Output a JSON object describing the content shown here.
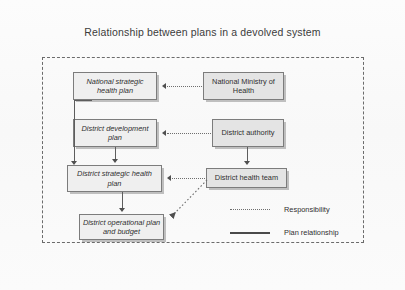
{
  "figure": {
    "title": "Relationship between plans in a devolved system"
  },
  "nodes": {
    "national_plan": "National strategic health plan",
    "district_development_plan": "District development plan",
    "district_strategic_plan": "District strategic health plan",
    "district_operational_plan": "District operational plan and budget",
    "national_ministry": "National Ministry of Health",
    "district_authority": "District authority",
    "district_health_team": "District health team"
  },
  "legend": {
    "responsibility": "Responsibility",
    "plan_relationship": "Plan relationship"
  },
  "colors": {
    "box_fill_plan": "#efefef",
    "box_fill_org": "#e4e4e4",
    "box_border": "#7c7c7c",
    "line": "#5d5d5d",
    "frame": "#6b6b6b",
    "text": "#2f2f2f"
  },
  "diagram_data": {
    "type": "flow-diagram",
    "columns": [
      "plans",
      "organizations"
    ],
    "edges": [
      {
        "from": "national_ministry",
        "to": "national_plan",
        "style": "dotted",
        "meaning": "Responsibility"
      },
      {
        "from": "district_authority",
        "to": "district_development_plan",
        "style": "dotted",
        "meaning": "Responsibility"
      },
      {
        "from": "district_health_team",
        "to": "district_strategic_plan",
        "style": "dotted",
        "meaning": "Responsibility"
      },
      {
        "from": "district_health_team",
        "to": "district_operational_plan",
        "style": "dotted",
        "meaning": "Responsibility"
      },
      {
        "from": "district_authority",
        "to": "district_health_team",
        "style": "solid",
        "meaning": "Plan relationship"
      },
      {
        "from": "national_plan",
        "to": "district_strategic_plan",
        "style": "solid",
        "meaning": "Plan relationship"
      },
      {
        "from": "district_development_plan",
        "to": "district_strategic_plan",
        "style": "solid",
        "meaning": "Plan relationship"
      },
      {
        "from": "district_strategic_plan",
        "to": "district_operational_plan",
        "style": "solid",
        "meaning": "Plan relationship"
      }
    ]
  }
}
